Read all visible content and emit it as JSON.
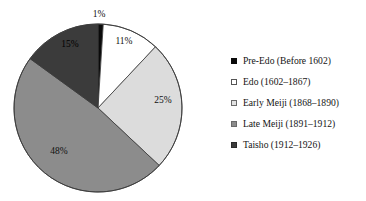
{
  "figure": {
    "background_color": "#ffffff",
    "stroke_color": "#3a3a3a"
  },
  "chart_data": {
    "type": "pie",
    "title": "",
    "categories": [
      "Pre-Edo (Before 1602)",
      "Edo (1602–1867)",
      "Early Meiji (1868–1890)",
      "Late Meiji (1891–1912)",
      "Taisho (1912–1926)"
    ],
    "values": [
      1,
      11,
      25,
      48,
      15
    ],
    "data_labels": [
      "1%",
      "11%",
      "25%",
      "48%",
      "15%"
    ],
    "colors": [
      "#0a0a0a",
      "#ffffff",
      "#dcdcdc",
      "#8c8c8c",
      "#3b3b3b"
    ],
    "start_angle_deg": 0,
    "direction": "clockwise",
    "legend_position": "right",
    "grid": false,
    "xlabel": "",
    "ylabel": ""
  },
  "pie": {
    "center_x": 98,
    "center_y": 108,
    "radius": 84,
    "labels": [
      {
        "text": "1%",
        "x": 99,
        "y": 15,
        "tone": "dark"
      },
      {
        "text": "11%",
        "x": 124,
        "y": 42,
        "tone": "dark"
      },
      {
        "text": "25%",
        "x": 163,
        "y": 101,
        "tone": "dark"
      },
      {
        "text": "48%",
        "x": 59,
        "y": 152,
        "tone": "dark"
      },
      {
        "text": "15%",
        "x": 70,
        "y": 45,
        "tone": "onblack"
      }
    ]
  },
  "legend": {
    "items": [
      {
        "label": "Pre-Edo (Before 1602)",
        "color": "#0a0a0a",
        "border": "#0a0a0a"
      },
      {
        "label": "Edo (1602–1867)",
        "color": "#ffffff",
        "border": "#555555"
      },
      {
        "label": "Early Meiji (1868–1890)",
        "color": "#e2e2e2",
        "border": "#6a6a6a"
      },
      {
        "label": "Late Meiji (1891–1912)",
        "color": "#8c8c8c",
        "border": "#6a6a6a"
      },
      {
        "label": "Taisho (1912–1926)",
        "color": "#3b3b3b",
        "border": "#2a2a2a"
      }
    ]
  }
}
